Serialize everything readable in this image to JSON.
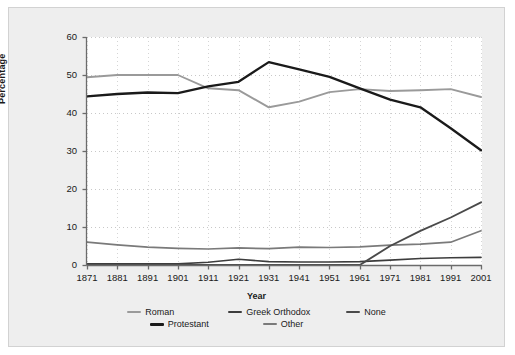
{
  "chart_data": {
    "type": "line",
    "title": "",
    "xlabel": "Year",
    "ylabel": "Percentage",
    "ylim": [
      0,
      60
    ],
    "yticks": [
      0,
      10,
      20,
      30,
      40,
      50,
      60
    ],
    "grid": true,
    "legend_position": "bottom",
    "categories": [
      1871,
      1881,
      1891,
      1901,
      1911,
      1921,
      1931,
      1941,
      1951,
      1961,
      1971,
      1981,
      1991,
      2001
    ],
    "xtick_labels": [
      "1871",
      "1881",
      "1891",
      "1901",
      "1911",
      "1921",
      "1931",
      "1941",
      "1951",
      "1961",
      "1971",
      "1981",
      "1991",
      "2001"
    ],
    "series": [
      {
        "name": "Roman",
        "color": "#9a9a9a",
        "width": 1.9,
        "values": [
          49.4,
          50.0,
          50.0,
          50.0,
          46.5,
          46.0,
          41.5,
          43.0,
          45.5,
          46.3,
          45.8,
          46.0,
          46.3,
          44.2
        ]
      },
      {
        "name": "Protestant",
        "color": "#1a1a1a",
        "width": 2.3,
        "values": [
          44.4,
          45.0,
          45.4,
          45.2,
          47.0,
          48.2,
          53.4,
          51.5,
          49.5,
          46.5,
          43.5,
          41.5,
          36.0,
          30.2
        ]
      },
      {
        "name": "Greek Orthodox",
        "color": "#3d3d3d",
        "width": 1.6,
        "values": [
          0.3,
          0.3,
          0.3,
          0.3,
          0.7,
          1.5,
          0.9,
          0.8,
          0.8,
          0.9,
          1.3,
          1.7,
          1.9,
          2.0
        ]
      },
      {
        "name": "Other",
        "color": "#7a7a7a",
        "width": 1.7,
        "values": [
          6.0,
          5.3,
          4.7,
          4.4,
          4.2,
          4.5,
          4.3,
          4.7,
          4.6,
          4.8,
          5.2,
          5.5,
          6.0,
          9.0
        ]
      },
      {
        "name": "None",
        "color": "#4a4a4a",
        "width": 1.9,
        "values": [
          0.0,
          0.0,
          0.0,
          0.0,
          0.0,
          0.0,
          0.0,
          0.0,
          0.0,
          0.0,
          5.0,
          9.0,
          12.5,
          16.5
        ]
      }
    ]
  },
  "legend": {
    "rows": [
      [
        {
          "label": "Roman",
          "color": "#9a9a9a",
          "thickness": 2
        },
        {
          "label": "Greek Orthodox",
          "color": "#3d3d3d",
          "thickness": 2
        },
        {
          "label": "None",
          "color": "#4a4a4a",
          "thickness": 2
        }
      ],
      [
        {
          "label": "Protestant",
          "color": "#1a1a1a",
          "thickness": 3
        },
        {
          "label": "Other",
          "color": "#7a7a7a",
          "thickness": 2
        }
      ]
    ]
  },
  "style": {
    "panel_background": "#eeeeee",
    "panel_border": "#d2d2d2",
    "plot_background": "#ffffff",
    "axis_color": "#6b6b6b",
    "grid_color": "#c8c8c8",
    "text_color": "#1a1a1a"
  }
}
